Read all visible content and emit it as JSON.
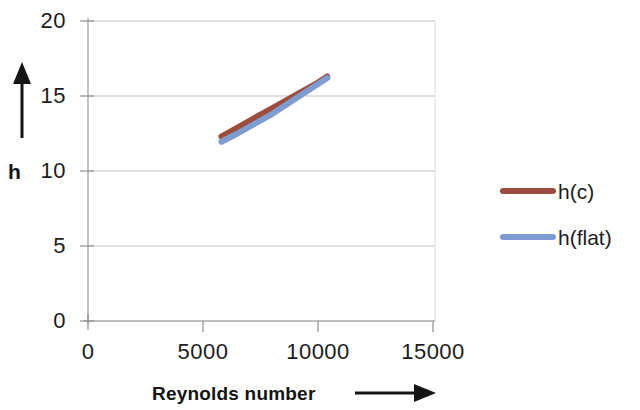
{
  "chart_data": {
    "type": "line",
    "title": "",
    "xlabel": "Reynolds number",
    "ylabel": "h",
    "xlim": [
      0,
      15000
    ],
    "ylim": [
      0,
      20
    ],
    "xticks": [
      "0",
      "5000",
      "10000",
      "15000"
    ],
    "xtick_values": [
      0,
      5000,
      10000,
      15000
    ],
    "yticks": [
      "0",
      "5",
      "10",
      "15",
      "20"
    ],
    "ytick_values": [
      0,
      5,
      10,
      15,
      20
    ],
    "grid": true,
    "grid_axis": "y",
    "legend_position": "right",
    "series": [
      {
        "name": "h(c)",
        "color": "#9c4c3c",
        "x": [
          5800,
          6500,
          7200,
          7900,
          8600,
          9300,
          10000,
          10400
        ],
        "values": [
          12.3,
          12.9,
          13.5,
          14.1,
          14.7,
          15.3,
          15.9,
          16.3
        ]
      },
      {
        "name": "h(flat)",
        "color": "#7f9cd1",
        "x": [
          5800,
          6500,
          7200,
          7900,
          8600,
          9300,
          10000,
          10400
        ],
        "values": [
          11.95,
          12.5,
          13.1,
          13.7,
          14.4,
          15.1,
          15.8,
          16.2
        ]
      }
    ]
  },
  "axes": {
    "y_arrow": "up-arrow",
    "x_arrow": "right-arrow",
    "y_axis_label": "h",
    "x_axis_label": "Reynolds number"
  },
  "legend": {
    "entries": [
      {
        "label": "h(c)",
        "color": "#9c4c3c"
      },
      {
        "label": "h(flat)",
        "color": "#7f9cd1"
      }
    ]
  },
  "colors": {
    "series_1": "#9c4c3c",
    "series_2": "#7f9cd1",
    "grid": "#c9c9c9",
    "axis": "#9a9a9a",
    "text": "#1c1c1c"
  }
}
